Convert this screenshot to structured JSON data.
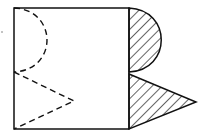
{
  "diagram": {
    "colors": {
      "stroke": "#111111",
      "background": "#ffffff"
    },
    "square": {
      "x": 14,
      "y": 8,
      "width": 115,
      "height": 121
    },
    "left_dashed_semicircle": {
      "from": [
        14,
        8
      ],
      "to": [
        14,
        72
      ],
      "bulge_x": 47
    },
    "left_dashed_triangle": {
      "points": [
        [
          14,
          72
        ],
        [
          74,
          101
        ],
        [
          14,
          129
        ]
      ]
    },
    "right_hatched_semicircle": {
      "from": [
        129,
        8
      ],
      "to": [
        129,
        72
      ],
      "bulge_x": 161
    },
    "right_hatched_triangle": {
      "points": [
        [
          129,
          74
        ],
        [
          196,
          102
        ],
        [
          129,
          129
        ]
      ]
    },
    "dot": {
      "x": 2,
      "y": 32
    }
  }
}
